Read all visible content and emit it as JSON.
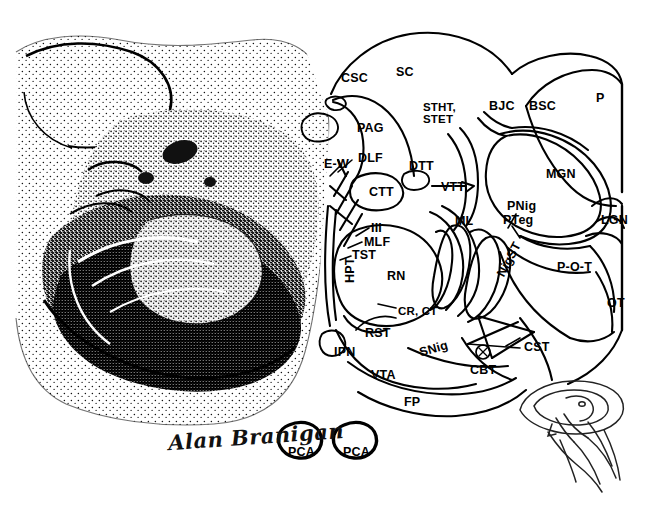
{
  "figure": {
    "signature": "Alan Branigan",
    "inset_name": "brain-orientation-inset"
  },
  "labels": [
    {
      "id": "csc",
      "text": "CSC",
      "x": 341,
      "y": 72,
      "rot": 0
    },
    {
      "id": "sc",
      "text": "SC",
      "x": 396,
      "y": 66,
      "rot": 0
    },
    {
      "id": "stht",
      "text": "STHT,\nSTET",
      "x": 423,
      "y": 102,
      "rot": 0
    },
    {
      "id": "bjc",
      "text": "BJC",
      "x": 489,
      "y": 100,
      "rot": 0
    },
    {
      "id": "bsc",
      "text": "BSC",
      "x": 529,
      "y": 100,
      "rot": 0
    },
    {
      "id": "p",
      "text": "P",
      "x": 596,
      "y": 92,
      "rot": 0
    },
    {
      "id": "pag",
      "text": "PAG",
      "x": 357,
      "y": 122,
      "rot": 0
    },
    {
      "id": "dlf",
      "text": "DLF",
      "x": 358,
      "y": 152,
      "rot": 0
    },
    {
      "id": "ew",
      "text": "E-W",
      "x": 324,
      "y": 158,
      "rot": 0
    },
    {
      "id": "dtt",
      "text": "DTT",
      "x": 409,
      "y": 160,
      "rot": 0
    },
    {
      "id": "vtt",
      "text": "VTT",
      "x": 441,
      "y": 181,
      "rot": 0
    },
    {
      "id": "mgn",
      "text": "MGN",
      "x": 546,
      "y": 168,
      "rot": 0
    },
    {
      "id": "ctt",
      "text": "CTT",
      "x": 369,
      "y": 186,
      "rot": 0
    },
    {
      "id": "pnig",
      "text": "PNig",
      "x": 507,
      "y": 200,
      "rot": 0
    },
    {
      "id": "pteg",
      "text": "PTeg",
      "x": 503,
      "y": 214,
      "rot": 0
    },
    {
      "id": "lgn",
      "text": "LGN",
      "x": 601,
      "y": 214,
      "rot": 0
    },
    {
      "id": "iii",
      "text": "III",
      "x": 371,
      "y": 222,
      "rot": 0
    },
    {
      "id": "ml",
      "text": "ML",
      "x": 455,
      "y": 215,
      "rot": 0
    },
    {
      "id": "mlf",
      "text": "MLF",
      "x": 364,
      "y": 236,
      "rot": 0
    },
    {
      "id": "tst",
      "text": "TST",
      "x": 352,
      "y": 249,
      "rot": 0
    },
    {
      "id": "pot",
      "text": "P-O-T",
      "x": 557,
      "y": 261,
      "rot": 0
    },
    {
      "id": "rn",
      "text": "RN",
      "x": 387,
      "y": 270,
      "rot": 0
    },
    {
      "id": "hpt",
      "text": "HPT",
      "x": 344,
      "y": 283,
      "rot": -90
    },
    {
      "id": "nigst",
      "text": "NigST",
      "x": 495,
      "y": 273,
      "rot": -62
    },
    {
      "id": "ot",
      "text": "OT",
      "x": 607,
      "y": 297,
      "rot": 0
    },
    {
      "id": "crct",
      "text": "CR, CT",
      "x": 398,
      "y": 306,
      "rot": 0
    },
    {
      "id": "rst",
      "text": "RST",
      "x": 365,
      "y": 327,
      "rot": 0
    },
    {
      "id": "cst",
      "text": "CST",
      "x": 524,
      "y": 341,
      "rot": 0
    },
    {
      "id": "ipn",
      "text": "IPN",
      "x": 334,
      "y": 346,
      "rot": 0
    },
    {
      "id": "snig",
      "text": "SNig",
      "x": 418,
      "y": 347,
      "rot": -16
    },
    {
      "id": "cbt",
      "text": "CBT",
      "x": 470,
      "y": 364,
      "rot": 0
    },
    {
      "id": "vta",
      "text": "VTA",
      "x": 371,
      "y": 369,
      "rot": 0
    },
    {
      "id": "fp",
      "text": "FP",
      "x": 404,
      "y": 396,
      "rot": 0
    },
    {
      "id": "pca1",
      "text": "PCA",
      "x": 288,
      "y": 446,
      "rot": 0
    },
    {
      "id": "pca2",
      "text": "PCA",
      "x": 343,
      "y": 446,
      "rot": 0
    }
  ]
}
